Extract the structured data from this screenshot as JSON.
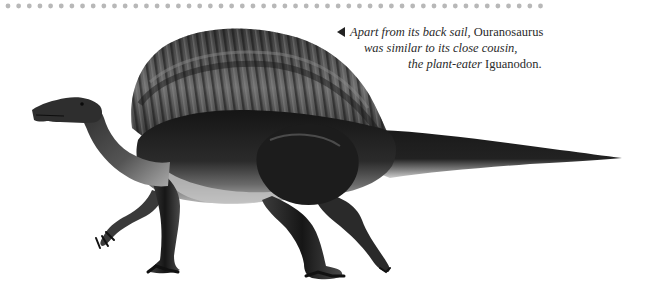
{
  "page": {
    "background": "#ffffff",
    "dot_rule": {
      "count": 51,
      "start_x": 8,
      "spacing": 10.65,
      "y": 6,
      "radius": 2.4,
      "color": "#b8b8b8"
    }
  },
  "illustration": {
    "subject": "Ouranosaurus",
    "icon": "dinosaur-illustration",
    "colors": {
      "dark": "#1b1b1b",
      "mid": "#4a4a4a",
      "light": "#9a9a9a",
      "belly": "#c9c9c9"
    }
  },
  "caption": {
    "pointer_icon": "left-triangle-pointer",
    "lines": [
      [
        {
          "text": "Apart from its back sail, ",
          "style": "italic"
        },
        {
          "text": "Ouranosaurus",
          "style": "roman"
        }
      ],
      [
        {
          "text": "was similar to its close cousin,",
          "style": "italic"
        }
      ],
      [
        {
          "text": "the plant-eater ",
          "style": "italic"
        },
        {
          "text": "Iguanodon.",
          "style": "roman"
        }
      ]
    ]
  }
}
